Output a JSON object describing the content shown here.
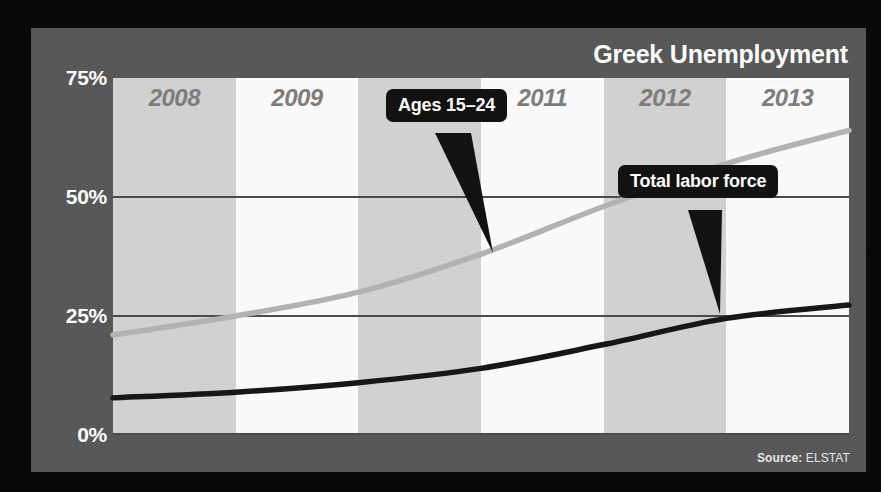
{
  "title": "Greek Unemployment",
  "source": {
    "prefix": "Source:",
    "value": "ELSTAT"
  },
  "yaxis": {
    "ticks": [
      "75%",
      "50%",
      "25%",
      "0%"
    ]
  },
  "xaxis": {
    "categories": [
      "2008",
      "2009",
      "2010",
      "2011",
      "2012",
      "2013"
    ]
  },
  "callouts": {
    "youth": "Ages 15–24",
    "total": "Total labor force"
  },
  "colors": {
    "panel": "#575757",
    "border": "#090909",
    "band_shade": "#d2d2d2",
    "band_light": "#fbfbfb",
    "gridline": "#4a4a4a",
    "youth_line": "#b3b3b3",
    "total_line": "#151515",
    "title_text": "#ffffff",
    "year_text": "#7d7d7d",
    "tick_text": "#ffffff",
    "callout_bg": "#101010",
    "callout_text": "#ffffff"
  },
  "chart_data": {
    "type": "line",
    "title": "Greek Unemployment",
    "xlabel": "",
    "ylabel": "",
    "ylim": [
      0,
      75
    ],
    "yticks": [
      0,
      25,
      50,
      75
    ],
    "grid": true,
    "legend": "annotated-callouts",
    "x": [
      "2008",
      "2009",
      "2010",
      "2011",
      "2012",
      "2013",
      "2013-end"
    ],
    "series": [
      {
        "name": "Ages 15–24",
        "color": "#b3b3b3",
        "values": [
          21,
          25,
          30,
          38,
          48,
          57,
          64
        ]
      },
      {
        "name": "Total labor force",
        "color": "#151515",
        "values": [
          7.8,
          9,
          11,
          14,
          19,
          24.5,
          27.3
        ]
      }
    ],
    "annotations": [
      {
        "text": "Ages 15–24",
        "points_to_series": "Ages 15–24",
        "at_x": "2011"
      },
      {
        "text": "Total labor force",
        "points_to_series": "Total labor force",
        "at_x": "2013"
      }
    ]
  }
}
